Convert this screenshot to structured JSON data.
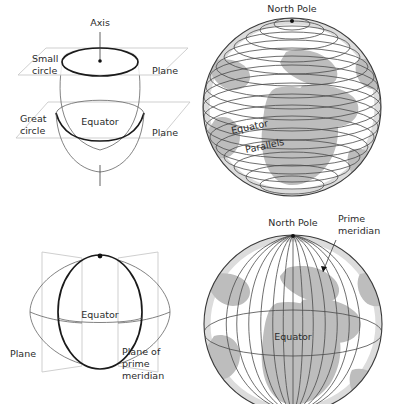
{
  "figure": {
    "background_color": "#ffffff",
    "land_color": "#bdbdbd",
    "line_color": "#3a3a3a",
    "text_color": "#2b2b2b"
  },
  "panels": [
    {
      "id": "small-and-great-circle",
      "position": "top-left",
      "description": "Sphere cut by two horizontal planes: an upper plane making a small circle and a central plane making a great circle (the equator), with the axis shown vertically.",
      "labels": {
        "axis": "Axis",
        "small_circle": "Small\ncircle",
        "small_circle_line1": "Small",
        "small_circle_line2": "circle",
        "plane_upper": "Plane",
        "great_circle_line1": "Great",
        "great_circle_line2": "circle",
        "equator": "Equator",
        "plane_lower": "Plane"
      }
    },
    {
      "id": "parallels-globe",
      "position": "top-right",
      "description": "Shaded globe of Africa, Europe and the Atlantic showing horizontal latitude lines.",
      "labels": {
        "north_pole": "North Pole",
        "equator": "Equator",
        "parallels": "Parallels"
      },
      "counts": {
        "parallels": 17
      }
    },
    {
      "id": "prime-meridian-plane",
      "position": "bottom-left",
      "description": "Sphere cut by two vertical planes meeting at the polar axis; the near plane is the plane of the prime meridian.",
      "labels": {
        "equator": "Equator",
        "plane": "Plane",
        "plane_of_prime_meridian_line1": "Plane of",
        "plane_of_prime_meridian_line2": "prime",
        "plane_of_prime_meridian_line3": "meridian"
      }
    },
    {
      "id": "meridians-globe",
      "position": "bottom-right",
      "description": "Shaded globe showing vertical meridian lines converging at the North Pole, with the prime meridian indicated.",
      "labels": {
        "north_pole": "North Pole",
        "prime_meridian_line1": "Prime",
        "prime_meridian_line2": "meridian",
        "equator": "Equator"
      },
      "counts": {
        "meridians": 13
      }
    }
  ]
}
